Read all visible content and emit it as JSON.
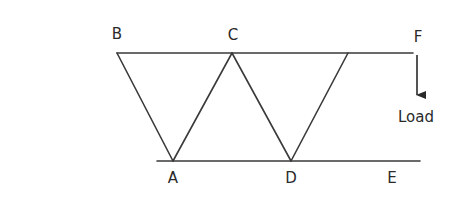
{
  "diagram": {
    "type": "truss",
    "colors": {
      "line": "#3a3a3a",
      "text": "#2a2a2a",
      "background": "#ffffff"
    },
    "nodes": {
      "B": {
        "x": 117,
        "y": 53,
        "label": "B",
        "label_x": 117,
        "label_y": 34
      },
      "C": {
        "x": 232,
        "y": 53,
        "label": "C",
        "label_x": 233,
        "label_y": 35
      },
      "G": {
        "x": 348,
        "y": 53
      },
      "F": {
        "x": 413,
        "y": 53,
        "label": "F",
        "label_x": 418,
        "label_y": 37
      },
      "A": {
        "x": 173,
        "y": 161,
        "label": "A",
        "label_x": 173,
        "label_y": 178
      },
      "D": {
        "x": 291,
        "y": 161,
        "label": "D",
        "label_x": 291,
        "label_y": 178
      },
      "E": {
        "x": 392,
        "y": 161,
        "label": "E",
        "label_x": 392,
        "label_y": 178
      }
    },
    "members": [
      {
        "name": "top-chord-BF",
        "x1": 117,
        "y1": 53,
        "x2": 413,
        "y2": 53
      },
      {
        "name": "bottom-ground-line",
        "x1": 157,
        "y1": 161,
        "x2": 420,
        "y2": 161
      },
      {
        "name": "member-BA",
        "x1": 117,
        "y1": 53,
        "x2": 173,
        "y2": 161
      },
      {
        "name": "member-AC",
        "x1": 173,
        "y1": 161,
        "x2": 232,
        "y2": 53
      },
      {
        "name": "member-CD",
        "x1": 232,
        "y1": 53,
        "x2": 291,
        "y2": 161
      },
      {
        "name": "member-DG",
        "x1": 291,
        "y1": 161,
        "x2": 348,
        "y2": 53
      }
    ],
    "load": {
      "label": "Load",
      "label_x": 416,
      "label_y": 117,
      "arrow": {
        "x": 417,
        "y1": 55,
        "y2": 95
      }
    }
  }
}
